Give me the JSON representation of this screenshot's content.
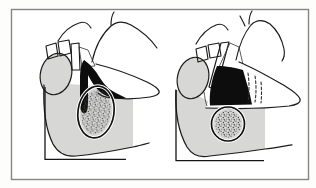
{
  "figure": {
    "panels": [
      {
        "id": "left",
        "label": "joint-with-disc-seated"
      },
      {
        "id": "right",
        "label": "joint-with-disc-displaced"
      }
    ]
  },
  "colors": {
    "page": "#fdfdfc",
    "border": "#868686",
    "tissue_gray": "#d7d7d6",
    "outline": "#1b1b1b",
    "disc_black": "#0d0d0d",
    "stipple": "#4a4a4a",
    "white": "#ffffff"
  }
}
